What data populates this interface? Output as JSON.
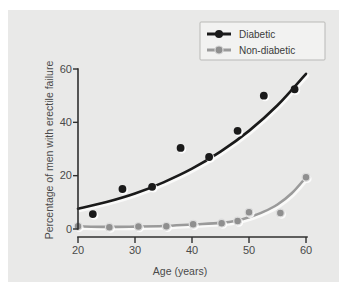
{
  "chart_data": {
    "type": "scatter",
    "title": "",
    "subtitle": "",
    "xlabel": "Age (years)",
    "ylabel": "Percentage of men with erectile failure",
    "xlim": [
      20,
      60
    ],
    "ylim": [
      0,
      60
    ],
    "xticks": [
      20,
      30,
      40,
      50,
      60
    ],
    "yticks": [
      0,
      20,
      40,
      60
    ],
    "xtick_labels": [
      "20",
      "30",
      "40",
      "50",
      "60"
    ],
    "ytick_labels": [
      "0",
      "20",
      "40",
      "60"
    ],
    "grid": false,
    "legend_position": "top-right",
    "series": [
      {
        "name": "Diabetic",
        "color": "#1a1a1a",
        "marker": "filled-circle",
        "points": [
          {
            "x": 22.6,
            "y": 5.6
          },
          {
            "x": 27.8,
            "y": 15.0
          },
          {
            "x": 33.0,
            "y": 15.8
          },
          {
            "x": 38.0,
            "y": 30.4
          },
          {
            "x": 43.0,
            "y": 27.0
          },
          {
            "x": 48.0,
            "y": 36.8
          },
          {
            "x": 52.6,
            "y": 50.0
          },
          {
            "x": 58.0,
            "y": 52.4
          }
        ],
        "fit_curve": [
          {
            "x": 20.0,
            "y": 7.6
          },
          {
            "x": 25.0,
            "y": 10.1
          },
          {
            "x": 30.0,
            "y": 13.3
          },
          {
            "x": 35.0,
            "y": 17.5
          },
          {
            "x": 40.0,
            "y": 22.6
          },
          {
            "x": 45.0,
            "y": 29.0
          },
          {
            "x": 50.0,
            "y": 36.8
          },
          {
            "x": 55.0,
            "y": 46.4
          },
          {
            "x": 60.0,
            "y": 58.2
          }
        ]
      },
      {
        "name": "Non-diabetic",
        "color": "#9a9a9a",
        "marker": "open-circle",
        "points": [
          {
            "x": 20.0,
            "y": 1.0
          },
          {
            "x": 25.5,
            "y": 0.7
          },
          {
            "x": 30.6,
            "y": 0.9
          },
          {
            "x": 35.5,
            "y": 1.0
          },
          {
            "x": 40.2,
            "y": 1.8
          },
          {
            "x": 45.2,
            "y": 2.2
          },
          {
            "x": 48.0,
            "y": 3.0
          },
          {
            "x": 50.0,
            "y": 6.3
          },
          {
            "x": 55.5,
            "y": 6.0
          },
          {
            "x": 60.0,
            "y": 19.4
          }
        ],
        "fit_curve": [
          {
            "x": 20.0,
            "y": 1.0
          },
          {
            "x": 25.0,
            "y": 0.8
          },
          {
            "x": 30.0,
            "y": 0.9
          },
          {
            "x": 35.0,
            "y": 1.1
          },
          {
            "x": 40.0,
            "y": 1.7
          },
          {
            "x": 45.0,
            "y": 2.3
          },
          {
            "x": 48.0,
            "y": 3.2
          },
          {
            "x": 50.0,
            "y": 4.4
          },
          {
            "x": 52.5,
            "y": 6.4
          },
          {
            "x": 55.0,
            "y": 9.2
          },
          {
            "x": 57.5,
            "y": 13.4
          },
          {
            "x": 60.0,
            "y": 19.4
          }
        ]
      }
    ]
  },
  "legend": {
    "entries": [
      {
        "label": "Diabetic",
        "color": "#1a1a1a"
      },
      {
        "label": "Non-diabetic",
        "color": "#9a9a9a"
      }
    ]
  },
  "axes": {
    "x_title": "Age (years)",
    "y_title": "Percentage of men with erectile failure",
    "x_tick_0": "20",
    "x_tick_1": "30",
    "x_tick_2": "40",
    "x_tick_3": "50",
    "x_tick_4": "60",
    "y_tick_0": "0",
    "y_tick_1": "20",
    "y_tick_2": "40",
    "y_tick_3": "60"
  },
  "colors": {
    "panel_background": "#e9e9e8",
    "figure_background": "#ffffff",
    "axis": "#2f2f2f",
    "diabetic": "#1a1a1a",
    "non_diabetic": "#9a9a9a",
    "text": "#4a4a4a"
  }
}
